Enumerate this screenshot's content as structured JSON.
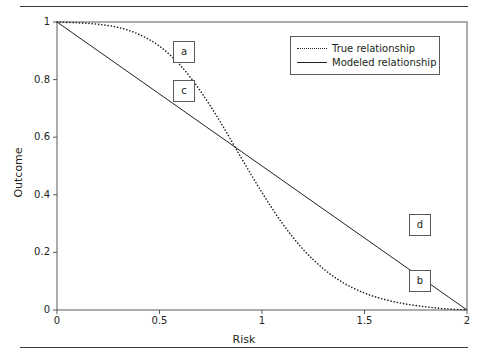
{
  "chart_data": {
    "type": "line",
    "title": "",
    "xlabel": "Risk",
    "ylabel": "Outcome",
    "xlim": [
      0,
      2
    ],
    "ylim": [
      0,
      1
    ],
    "xticks": [
      "0",
      "0.5",
      "1",
      "1.5",
      "2"
    ],
    "xtick_values": [
      0,
      0.5,
      1,
      1.5,
      2
    ],
    "yticks": [
      "0",
      "0.2",
      "0.4",
      "0.6",
      "0.8",
      "1"
    ],
    "ytick_values": [
      0,
      0.2,
      0.4,
      0.6,
      0.8,
      1
    ],
    "grid": false,
    "legend_position": "top-right",
    "series": [
      {
        "name": "True relationship",
        "style": "dotted",
        "color": "#231f20",
        "x": [
          0.0,
          0.1,
          0.2,
          0.3,
          0.4,
          0.5,
          0.6,
          0.7,
          0.8,
          0.9,
          1.0,
          1.1,
          1.2,
          1.3,
          1.4,
          1.5,
          1.6,
          1.7,
          1.8,
          1.9,
          2.0
        ],
        "y": [
          1.0,
          0.997,
          0.992,
          0.981,
          0.957,
          0.916,
          0.851,
          0.76,
          0.649,
          0.527,
          0.408,
          0.3,
          0.211,
          0.143,
          0.093,
          0.059,
          0.036,
          0.021,
          0.011,
          0.004,
          0.0
        ]
      },
      {
        "name": "Modeled relationship",
        "style": "solid",
        "color": "#231f20",
        "x": [
          0,
          2
        ],
        "y": [
          1,
          0
        ]
      }
    ],
    "annotations": [
      {
        "label": "a",
        "series": "True relationship",
        "x_box": 0.62,
        "y_box": 0.895
      },
      {
        "label": "c",
        "series": "Modeled relationship",
        "x_box": 0.62,
        "y_box": 0.76
      },
      {
        "label": "d",
        "series": "Modeled relationship",
        "x_box": 1.77,
        "y_box": 0.295
      },
      {
        "label": "b",
        "series": "True relationship",
        "x_box": 1.77,
        "y_box": 0.1
      }
    ]
  },
  "legend": {
    "entries": [
      {
        "label": "True relationship",
        "style": "dotted"
      },
      {
        "label": "Modeled relationship",
        "style": "solid"
      }
    ]
  },
  "colors": {
    "ink": "#231f20",
    "frame": "#5a5a5a",
    "rule": "#3a3a3a",
    "background": "#ffffff"
  }
}
